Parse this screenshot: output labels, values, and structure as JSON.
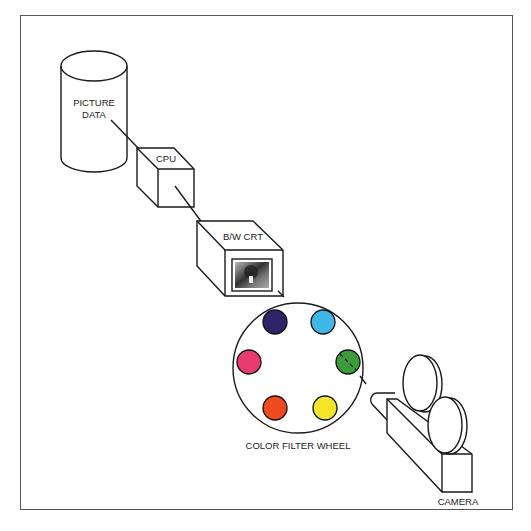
{
  "diagram": {
    "title": "",
    "nodes": {
      "picture_data": {
        "label_line1": "PICTURE",
        "label_line2": "DATA",
        "shape": "cylinder"
      },
      "cpu": {
        "label": "CPU",
        "shape": "cube"
      },
      "crt": {
        "label": "B/W CRT",
        "shape": "cube",
        "screen": "grayscale image"
      },
      "filter_wheel": {
        "label": "COLOR FILTER WHEEL",
        "filters": [
          {
            "name": "violet",
            "color": "#2e2366"
          },
          {
            "name": "cyan",
            "color": "#3fb8e8"
          },
          {
            "name": "magenta",
            "color": "#e83a6e"
          },
          {
            "name": "green",
            "color": "#3a9c3a",
            "active": true
          },
          {
            "name": "orange",
            "color": "#f04a1e"
          },
          {
            "name": "yellow",
            "color": "#f5e62a"
          }
        ]
      },
      "camera": {
        "label": "CAMERA",
        "shape": "film camera"
      }
    },
    "flow": [
      "picture_data",
      "cpu",
      "crt",
      "filter_wheel",
      "camera"
    ]
  }
}
